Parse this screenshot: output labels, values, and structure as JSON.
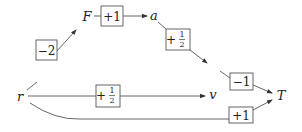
{
  "diagram": {
    "type": "causal-graph",
    "nodes": {
      "r": {
        "label": "r"
      },
      "F": {
        "label": "F"
      },
      "a": {
        "label": "a"
      },
      "v": {
        "label": "v"
      },
      "T": {
        "label": "T"
      }
    },
    "edges": [
      {
        "from": "r",
        "to": "F",
        "weight": "−2"
      },
      {
        "from": "F",
        "to": "a",
        "weight": "+1"
      },
      {
        "from": "a",
        "to": "v",
        "weight_sign": "+",
        "weight_num": "1",
        "weight_den": "2"
      },
      {
        "from": "r",
        "to": "v",
        "weight_sign": "+",
        "weight_num": "1",
        "weight_den": "2"
      },
      {
        "from": "v",
        "to": "T",
        "weight": "−1"
      },
      {
        "from": "r",
        "to": "T",
        "weight": "+1"
      }
    ]
  }
}
